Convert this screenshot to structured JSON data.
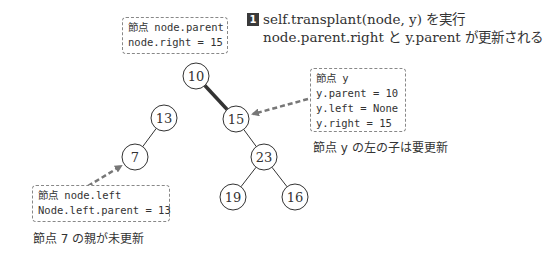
{
  "step": {
    "badge": "1",
    "line1": "self.transplant(node, y) を実行",
    "line2": "node.parent.right と y.parent が更新される"
  },
  "notes": {
    "parent": {
      "lines": [
        "節点 node.parent",
        "node.right = 15"
      ]
    },
    "y": {
      "lines": [
        "節点 y",
        "y.parent = 10",
        "y.left = None",
        "y.right = 15"
      ]
    },
    "left": {
      "lines": [
        "節点 node.left",
        "Node.left.parent = 13"
      ]
    }
  },
  "captions": {
    "y_left": "節点 y の左の子は要更新",
    "node7": "節点 7 の親が未更新"
  },
  "tree": {
    "nodes": [
      {
        "id": "n10",
        "label": "10"
      },
      {
        "id": "n15",
        "label": "15"
      },
      {
        "id": "n13",
        "label": "13"
      },
      {
        "id": "n7",
        "label": "7"
      },
      {
        "id": "n23",
        "label": "23"
      },
      {
        "id": "n19",
        "label": "19"
      },
      {
        "id": "n16",
        "label": "16"
      }
    ],
    "edges": [
      {
        "from": "n10",
        "to": "n15",
        "emphasis": true
      },
      {
        "from": "n13",
        "to": "n7",
        "emphasis": false
      },
      {
        "from": "n15",
        "to": "n23",
        "emphasis": false
      },
      {
        "from": "n23",
        "to": "n19",
        "emphasis": false
      },
      {
        "from": "n23",
        "to": "n16",
        "emphasis": false
      }
    ]
  },
  "colors": {
    "edge": "#333333",
    "arrow": "#777777",
    "note_border": "#888888",
    "badge": "#3a3a3a"
  }
}
